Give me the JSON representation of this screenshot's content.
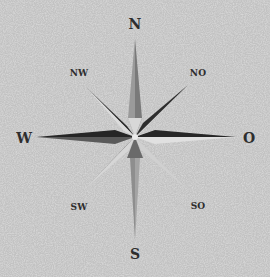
{
  "image": {
    "subject": "compass-rose",
    "background_color": "#c4c4c4"
  },
  "compass": {
    "center": {
      "x": 135,
      "y": 137
    },
    "labels": {
      "north": "N",
      "south": "S",
      "west": "W",
      "east": "O",
      "northwest": "NW",
      "northeast": "NO",
      "southwest": "SW",
      "southeast": "SO"
    },
    "colors": {
      "dark": "#2f2f2f",
      "mid": "#6e6e6e",
      "light": "#e2e2e2",
      "pale": "#b3b3b3",
      "label": "#2e2e2e"
    }
  }
}
